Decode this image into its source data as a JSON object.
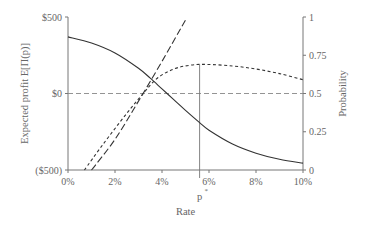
{
  "chart_data": {
    "type": "line",
    "title": "",
    "xlabel": "Rate",
    "ylabel_left": "Expected profit E[Π(p)]",
    "ylabel_right": "Probability",
    "x_ticks": [
      "0%",
      "2%",
      "4%",
      "6%",
      "8%",
      "10%"
    ],
    "y_left_ticks": [
      "$500",
      "$0",
      "($500)"
    ],
    "y_right_ticks": [
      "1",
      "0.75",
      "0.5",
      "0.25",
      "0"
    ],
    "xlim": [
      0,
      10
    ],
    "ylim_left": [
      -500,
      500
    ],
    "ylim_right": [
      0,
      1
    ],
    "grid": false,
    "annotation": {
      "label": "p",
      "superscript": "*",
      "x": 5.6
    },
    "reference_line": {
      "axis": "left",
      "y": 0,
      "style": "dashed"
    },
    "series": [
      {
        "name": "Expected profit",
        "axis": "left",
        "style": "solid",
        "x": [
          0,
          1,
          2,
          3,
          3.5,
          4,
          4.5,
          5,
          5.6,
          6,
          7,
          8,
          9,
          10
        ],
        "values": [
          370,
          330,
          265,
          165,
          100,
          30,
          -40,
          -110,
          -190,
          -240,
          -330,
          -390,
          -430,
          -455
        ]
      },
      {
        "name": "Probability (short dash)",
        "axis": "right",
        "style": "short-dash",
        "x": [
          0.7,
          1.5,
          2.5,
          3.2,
          3.8,
          4.5,
          5.2,
          5.9,
          7,
          8,
          9,
          10
        ],
        "values": [
          0,
          0.17,
          0.37,
          0.5,
          0.6,
          0.66,
          0.685,
          0.69,
          0.68,
          0.66,
          0.63,
          0.59
        ]
      },
      {
        "name": "Probability (long dash)",
        "axis": "right",
        "style": "long-dash",
        "x": [
          1.0,
          2.0,
          3.0,
          4.0,
          5.0
        ],
        "values": [
          0,
          0.2,
          0.45,
          0.71,
          0.98
        ]
      }
    ]
  },
  "colors": {
    "axis": "#777777",
    "curve": "#333333",
    "reference": "#888888"
  }
}
